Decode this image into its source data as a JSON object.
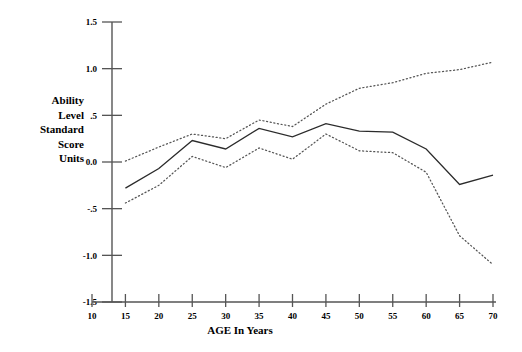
{
  "chart_data": {
    "type": "line",
    "title": "",
    "subtitle": "",
    "xlabel": "AGE In Years",
    "ylabel": "Ability Level Standard Score Units",
    "ylabel_lines": [
      "Ability",
      "Level",
      "Standard",
      "Score",
      "Units"
    ],
    "xlim": [
      10,
      70
    ],
    "ylim": [
      -1.5,
      1.5
    ],
    "xticks": [
      10,
      15,
      20,
      25,
      30,
      35,
      40,
      45,
      50,
      55,
      60,
      65,
      70
    ],
    "xtick_labels": [
      "10",
      "15",
      "20",
      "25",
      "30",
      "35",
      "40",
      "45",
      "50",
      "55",
      "60",
      "65",
      "70"
    ],
    "yticks": [
      1.5,
      1.0,
      0.5,
      0.0,
      -0.5,
      -1.0,
      -1.5
    ],
    "ytick_labels": [
      "1.5",
      "1.0",
      ".5",
      "0.0",
      "-.5",
      "-1.0",
      "-1.5"
    ],
    "grid": false,
    "legend": "none",
    "x": [
      15,
      20,
      25,
      30,
      35,
      40,
      45,
      50,
      55,
      60,
      65,
      70
    ],
    "series": [
      {
        "name": "Mean ability level",
        "style": "solid",
        "color": "#2b2b2b",
        "values": [
          -0.28,
          -0.07,
          0.23,
          0.14,
          0.36,
          0.27,
          0.41,
          0.33,
          0.32,
          0.14,
          -0.24,
          -0.14
        ]
      },
      {
        "name": "Upper confidence band",
        "style": "dotted",
        "color": "#555555",
        "values": [
          0.01,
          0.16,
          0.3,
          0.25,
          0.45,
          0.38,
          0.62,
          0.79,
          0.85,
          0.95,
          0.99,
          1.07
        ]
      },
      {
        "name": "Lower confidence band",
        "style": "dotted",
        "color": "#555555",
        "values": [
          -0.44,
          -0.25,
          0.06,
          -0.06,
          0.15,
          0.03,
          0.3,
          0.12,
          0.1,
          -0.11,
          -0.79,
          -1.1
        ]
      }
    ]
  },
  "axis": {
    "x_title": "AGE In Years",
    "y_title_lines": [
      "Ability",
      "Level",
      "Standard",
      "Score",
      "Units"
    ]
  },
  "colors": {
    "axis": "#555555",
    "solid_series": "#2b2b2b",
    "dotted_series": "#555555",
    "background": "#ffffff",
    "text": "#000000"
  }
}
